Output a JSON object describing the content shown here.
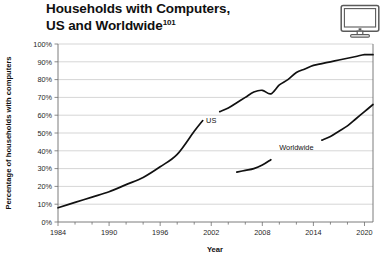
{
  "header": {
    "title_line1": "Households with Computers,",
    "title_line2": "US and Worldwide",
    "title_footnote": "101",
    "icon": "desktop-computer-icon"
  },
  "chart_data": {
    "type": "line",
    "title": "Households with Computers, US and Worldwide",
    "xlabel": "Year",
    "ylabel": "Percentage of households with computers",
    "xlim": [
      1984,
      2021
    ],
    "ylim": [
      0,
      100
    ],
    "grid": true,
    "legend_position": "inline-annotations",
    "xticks": [
      1984,
      1990,
      1996,
      2002,
      2008,
      2014,
      2020
    ],
    "xtick_labels": [
      "1984",
      "1990",
      "1996",
      "2002",
      "2008",
      "2014",
      "2020"
    ],
    "xminor_tick_interval": 2,
    "yticks": [
      0,
      10,
      20,
      30,
      40,
      50,
      60,
      70,
      80,
      90,
      100
    ],
    "ytick_labels": [
      "0%",
      "10%",
      "20%",
      "30%",
      "40%",
      "50%",
      "60%",
      "70%",
      "80%",
      "90%",
      "100%"
    ],
    "line_color": "#111111",
    "series": [
      {
        "name": "US",
        "label": "US",
        "label_x": 2002,
        "label_y": 57,
        "x": [
          1984,
          1986,
          1988,
          1990,
          1992,
          1994,
          1996,
          1998,
          2000,
          2001,
          2002,
          2003,
          2004,
          2005,
          2006,
          2007,
          2008,
          2009,
          2010,
          2011,
          2012,
          2013,
          2014,
          2015,
          2016,
          2017,
          2018,
          2019,
          2020,
          2021
        ],
        "values": [
          8,
          11,
          14,
          17,
          21,
          25,
          31,
          38,
          51,
          57,
          62,
          62,
          64,
          67,
          70,
          73,
          74,
          72,
          77,
          80,
          84,
          86,
          88,
          89,
          90,
          91,
          92,
          93,
          94,
          94
        ]
      },
      {
        "name": "Worldwide",
        "label": "Worldwide",
        "label_x": 2012,
        "label_y": 42,
        "x": [
          2005,
          2006,
          2007,
          2008,
          2009,
          2010,
          2011,
          2012,
          2013,
          2014,
          2015,
          2016,
          2017,
          2018,
          2019,
          2020,
          2021
        ],
        "values": [
          28,
          29,
          30,
          32,
          35,
          37,
          38,
          40,
          42,
          44,
          46,
          48,
          51,
          54,
          58,
          62,
          66
        ]
      }
    ]
  }
}
